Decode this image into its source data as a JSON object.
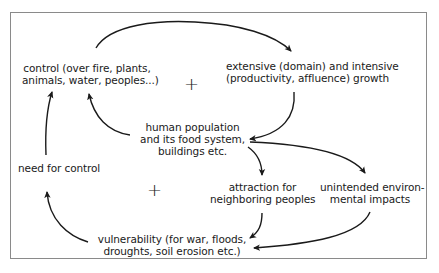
{
  "diagram": {
    "type": "causal-loop",
    "nodes": {
      "control": {
        "lines": [
          "control (over fire, plants,",
          "animals, water, peoples...)"
        ]
      },
      "growth": {
        "lines": [
          "extensive (domain) and intensive",
          "(productivity, affluence) growth"
        ]
      },
      "population": {
        "lines": [
          "human population",
          "and its food system,",
          "buildings etc."
        ]
      },
      "need_control": {
        "lines": [
          "need for control"
        ]
      },
      "attraction": {
        "lines": [
          "attraction for",
          "neighboring peoples"
        ]
      },
      "impacts": {
        "lines": [
          "unintended environ-",
          "mental impacts"
        ]
      },
      "vulnerability": {
        "lines": [
          "vulnerability (for war, floods,",
          "droughts, soil erosion etc.)"
        ]
      }
    },
    "loop_signs": [
      "+",
      "+"
    ],
    "edges": [
      {
        "from": "control",
        "to": "growth"
      },
      {
        "from": "growth",
        "to": "population"
      },
      {
        "from": "population",
        "to": "control"
      },
      {
        "from": "population",
        "to": "attraction"
      },
      {
        "from": "population",
        "to": "impacts"
      },
      {
        "from": "attraction",
        "to": "vulnerability"
      },
      {
        "from": "impacts",
        "to": "vulnerability"
      },
      {
        "from": "vulnerability",
        "to": "need_control"
      },
      {
        "from": "need_control",
        "to": "control"
      }
    ]
  }
}
